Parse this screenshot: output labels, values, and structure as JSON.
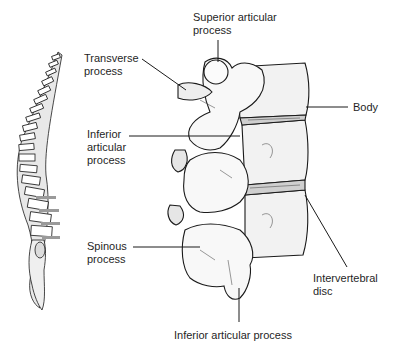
{
  "diagram": {
    "labels": {
      "superior_articular_process": "Superior articular\nprocess",
      "transverse_process": "Transverse\nprocess",
      "body": "Body",
      "inferior_articular_process_left": "Inferior\narticular\nprocess",
      "spinous_process": "Spinous\nprocess",
      "intervertebral_disc": "Intervertebral\ndisc",
      "inferior_articular_process_bottom": "Inferior articular process"
    },
    "colors": {
      "background": "#ffffff",
      "line": "#1a1a1a",
      "bone_fill": "#f4f4f4",
      "shade": "#b8b8b8"
    }
  }
}
